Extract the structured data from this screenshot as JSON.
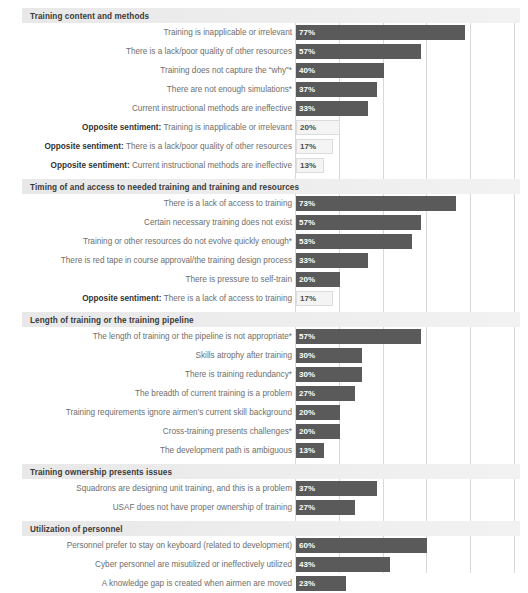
{
  "chart_data": {
    "type": "bar",
    "title": "",
    "xlabel": "",
    "ylabel": "",
    "orientation": "horizontal",
    "xlim": [
      0,
      100
    ],
    "grid": true,
    "gridlines_at": [
      0,
      20,
      40,
      60,
      80,
      100
    ],
    "legend": "none",
    "value_suffix": "%",
    "colors": {
      "primary_bar": "#5a5a5a",
      "opposite_sentiment_bar": "#f4f4f4",
      "opposite_sentiment_border": "#dcdcdc",
      "section_band": "#e8e8e8",
      "gridline": "#d8d8d8",
      "label_text": "#6e6e6e",
      "header_text": "#3a3a3a"
    },
    "sections": [
      {
        "name": "Training content and methods",
        "items": [
          {
            "label": "Training is inapplicable or irrelevant",
            "value": 77,
            "value_label": "77%",
            "opposite": false
          },
          {
            "label": "There is a lack/poor quality of other resources",
            "value": 57,
            "value_label": "57%",
            "opposite": false
          },
          {
            "label": "Training does not capture the “why”*",
            "value": 40,
            "value_label": "40%",
            "opposite": false
          },
          {
            "label": "There are not enough simulations*",
            "value": 37,
            "value_label": "37%",
            "opposite": false
          },
          {
            "label": "Current instructional methods are ineffective",
            "value": 33,
            "value_label": "33%",
            "opposite": false
          },
          {
            "prefix": "Opposite sentiment:",
            "label": "Training is inapplicable or irrelevant",
            "value": 20,
            "value_label": "20%",
            "opposite": true
          },
          {
            "prefix": "Opposite sentiment:",
            "label": "There is a lack/poor quality of other resources",
            "value": 17,
            "value_label": "17%",
            "opposite": true
          },
          {
            "prefix": "Opposite sentiment:",
            "label": "Current instructional methods are ineffective",
            "value": 13,
            "value_label": "13%",
            "opposite": true
          }
        ]
      },
      {
        "name": "Timing of and access to needed training and training and resources",
        "items": [
          {
            "label": "There is a lack of access to training",
            "value": 73,
            "value_label": "73%",
            "opposite": false
          },
          {
            "label": "Certain necessary training does not exist",
            "value": 57,
            "value_label": "57%",
            "opposite": false
          },
          {
            "label": "Training or other resources do not evolve quickly enough*",
            "value": 53,
            "value_label": "53%",
            "opposite": false
          },
          {
            "label": "There is red tape in course approval/the training design process",
            "value": 33,
            "value_label": "33%",
            "opposite": false
          },
          {
            "label": "There is pressure to self-train",
            "value": 20,
            "value_label": "20%",
            "opposite": false
          },
          {
            "prefix": "Opposite sentiment:",
            "label": "There is a lack of access to training",
            "value": 17,
            "value_label": "17%",
            "opposite": true
          }
        ]
      },
      {
        "name": "Length of training or the training pipeline",
        "items": [
          {
            "label": "The length of training or the pipeline is not appropriate*",
            "value": 57,
            "value_label": "57%",
            "opposite": false
          },
          {
            "label": "Skills atrophy after training",
            "value": 30,
            "value_label": "30%",
            "opposite": false
          },
          {
            "label": "There is training redundancy*",
            "value": 30,
            "value_label": "30%",
            "opposite": false
          },
          {
            "label": "The breadth of current training is a problem",
            "value": 27,
            "value_label": "27%",
            "opposite": false
          },
          {
            "label": "Training requirements ignore airmen’s current skill background",
            "value": 20,
            "value_label": "20%",
            "opposite": false
          },
          {
            "label": "Cross-training presents challenges*",
            "value": 20,
            "value_label": "20%",
            "opposite": false
          },
          {
            "label": "The development path is ambiguous",
            "value": 13,
            "value_label": "13%",
            "opposite": false
          }
        ]
      },
      {
        "name": "Training ownership presents issues",
        "items": [
          {
            "label": "Squadrons are designing unit training, and this is a problem",
            "value": 37,
            "value_label": "37%",
            "opposite": false
          },
          {
            "label": "USAF does not have proper ownership of training",
            "value": 27,
            "value_label": "27%",
            "opposite": false
          }
        ]
      },
      {
        "name": "Utilization of personnel",
        "items": [
          {
            "label": "Personnel prefer to stay on keyboard (related to development)",
            "value": 60,
            "value_label": "60%",
            "opposite": false
          },
          {
            "label": "Cyber personnel are misutilized or ineffectively utilized",
            "value": 43,
            "value_label": "43%",
            "opposite": false
          },
          {
            "label": "A knowledge gap is created when airmen are moved",
            "value": 23,
            "value_label": "23%",
            "opposite": false
          }
        ]
      }
    ]
  }
}
